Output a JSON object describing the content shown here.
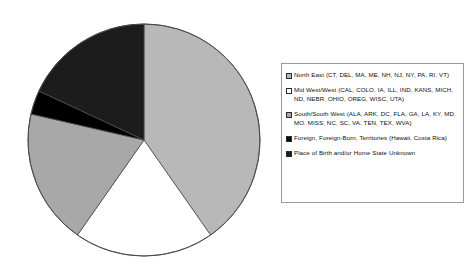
{
  "chart_data": {
    "type": "pie",
    "title": "",
    "subtitle": "",
    "xlabel": "",
    "ylabel": "",
    "grid": false,
    "legend_position": "right",
    "categories": [
      "North East (CT, DEL, MA, ME, NH, NJ, NY, PA, RI, VT)",
      "Mid West/West (CAL, COLO, IA, ILL, IND, KANS, MICH, ND, NEBR, OHIO, OREG, WISC, UTA)",
      "South/South West (ALA, ARK, DC, FLA, GA, LA, KY, MD, MO. MISS, NC, SC, VA, TEN, TEX, WVA)",
      "Foreign, Foreign-Born, Territories (Hawaii, Costa Rica)",
      "Place of Birth and/or Home State Unknown"
    ],
    "values": [
      40.3,
      19.4,
      18.9,
      3.3,
      18.1
    ],
    "slice_angles_deg": [
      {
        "start": 0,
        "end": 145
      },
      {
        "start": 145,
        "end": 215
      },
      {
        "start": 215,
        "end": 283
      },
      {
        "start": 283,
        "end": 295
      },
      {
        "start": 295,
        "end": 360
      }
    ],
    "colors": [
      "#b8b8b8",
      "#ffffff",
      "#a8a8a8",
      "#000000",
      "#1c1c1c"
    ],
    "stroke": "#4a4a4a"
  },
  "legend": {
    "items": [
      {
        "label": "North East (CT, DEL, MA, ME, NH, NJ, NY, PA, RI, VT)",
        "swatch": "#b8b8b8",
        "marker": "open-square-light"
      },
      {
        "label": "Mid West/West (CAL, COLO, IA, ILL, IND, KANS, MICH, ND, NEBR, OHIO, OREG, WISC, UTA)",
        "swatch": "#ffffff",
        "marker": "open-square-white"
      },
      {
        "label": "South/South West (ALA, ARK, DC, FLA, GA, LA, KY, MD, MO. MISS, NC, SC, VA, TEN, TEX, WVA)",
        "swatch": "#a8a8a8",
        "marker": "filled-square-gray"
      },
      {
        "label": "Foreign, Foreign-Born, Territories (Hawaii, Costa Rica)",
        "swatch": "#000000",
        "marker": "filled-square-black"
      },
      {
        "label": "Place of Birth and/or Home State Unknown",
        "swatch": "#1c1c1c",
        "marker": "filled-square-black"
      }
    ]
  }
}
